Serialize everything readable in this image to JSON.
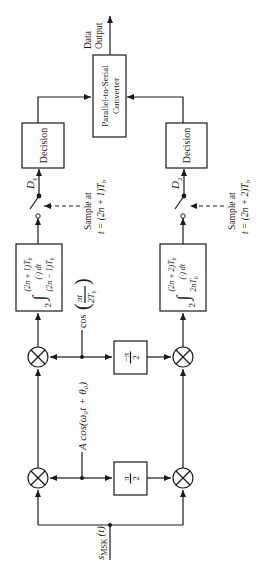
{
  "diagram": {
    "orientation": "rotated 90 degrees counter-clockwise",
    "input": {
      "label_main": "s",
      "label_sub": "MSK",
      "label_arg": "(t)"
    },
    "output": {
      "line1": "Data",
      "line2": "Output"
    },
    "carrier": {
      "label": "A cos(ω₀t + θ₀)"
    },
    "shaping": {
      "label_cos": "cos",
      "label_num": "πt",
      "label_den": "2T",
      "label_den_sub": "b"
    },
    "phase_shifters": [
      {
        "id": "ps-plus",
        "num": "π",
        "den": "2"
      },
      {
        "id": "ps-minus",
        "num": "−π",
        "den": "2"
      }
    ],
    "integrators": [
      {
        "id": "int-1",
        "coef": "2",
        "upper": "(2n + 1)T",
        "upper_sub": "b",
        "body": "(·) dt",
        "lower": "(2n − 1)T",
        "lower_sub": "b"
      },
      {
        "id": "int-2",
        "coef": "2",
        "upper": "(2n + 2)T",
        "upper_sub": "b",
        "body": "(·) dt",
        "lower": "2nT",
        "lower_sub": "b"
      }
    ],
    "samplers": [
      {
        "id": "sw-1",
        "out_label": "D",
        "out_sub": "1",
        "note_line1": "Sample at",
        "note_line2": "t = (2n + 1)T",
        "note_sub": "b"
      },
      {
        "id": "sw-2",
        "out_label": "D",
        "out_sub": "2",
        "note_line1": "Sample at",
        "note_line2": "t = (2n + 2)T",
        "note_sub": "b"
      }
    ],
    "decisions": [
      {
        "id": "dec-1",
        "label": "Decision"
      },
      {
        "id": "dec-2",
        "label": "Decision"
      }
    ],
    "converter": {
      "line1": "Parallel-to-Serial",
      "line2": "Converter"
    },
    "colors": {
      "ink": "#1a1a1a",
      "background": "#ffffff"
    }
  }
}
